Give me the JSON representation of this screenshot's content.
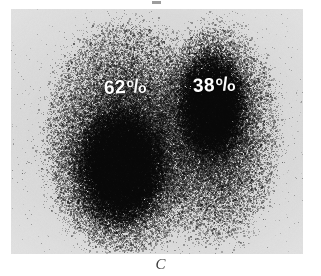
{
  "figure": {
    "caption": "C",
    "modality": "lung perfusion scintigram",
    "view": "posterior",
    "plate_background_color": "#dedede",
    "label_color": "#ffffff"
  },
  "labels": {
    "left_field": {
      "value": "62",
      "percent_symbol": "%",
      "full_text": "62%",
      "name": "left-lung-perfusion-percent"
    },
    "right_field": {
      "value": "38",
      "percent_symbol": "%",
      "full_text": "38%",
      "name": "right-lung-perfusion-percent"
    }
  },
  "chart_data": {
    "type": "heatmap",
    "title": "",
    "subtitle": "",
    "xlabel": "",
    "ylabel": "",
    "legend": [],
    "annotations": [
      "62%",
      "38%",
      "C"
    ],
    "categories": [
      "Left lung field",
      "Right lung field"
    ],
    "values": [
      62,
      38
    ],
    "units": "percent of total perfusion",
    "grid": false,
    "scan_fields": [
      {
        "name": "Left lung field",
        "percent": 62,
        "center_x": 115,
        "center_y": 130,
        "radius_x": 62,
        "radius_y": 95,
        "density": "high",
        "hot_spot_x": 110,
        "hot_spot_y": 160
      },
      {
        "name": "Right lung field",
        "percent": 38,
        "center_x": 205,
        "center_y": 125,
        "radius_x": 48,
        "radius_y": 90,
        "density": "moderate",
        "hot_spot_x": 200,
        "hot_spot_y": 95
      }
    ]
  }
}
